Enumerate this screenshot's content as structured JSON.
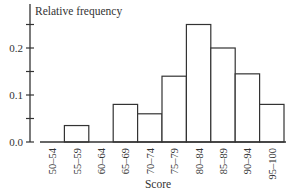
{
  "chart_data": {
    "type": "bar",
    "subtype": "histogram",
    "title": "",
    "xlabel": "Score",
    "ylabel": "Relative frequency",
    "categories": [
      "50–54",
      "55–59",
      "60–64",
      "65–69",
      "70–74",
      "75–79",
      "80–84",
      "85–89",
      "90–94",
      "95–100"
    ],
    "values": [
      0.0,
      0.035,
      0.0,
      0.08,
      0.06,
      0.14,
      0.25,
      0.2,
      0.145,
      0.08
    ],
    "ylim": [
      0,
      0.29
    ],
    "yticks": [
      0.0,
      0.1,
      0.2
    ],
    "ytick_labels": [
      "0.0",
      "0.1",
      "0.2"
    ],
    "minor_yticks": [
      0.05,
      0.15,
      0.25
    ],
    "grid": false,
    "legend": null
  }
}
